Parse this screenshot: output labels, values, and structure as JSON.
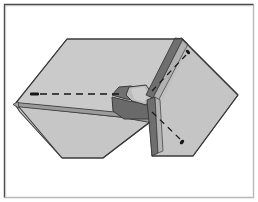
{
  "figure": {
    "title": "Folded sheet fold-line diagram",
    "caption": "",
    "canvas": {
      "width": 258,
      "height": 202
    },
    "colors": {
      "background": "#ffffff",
      "panel_fill": "#c9c9c9",
      "panel_fill_right": "#c4c4c4",
      "outline": "#3a3a3a",
      "crease_dark": "#6e6e6e",
      "crease_darker": "#555555",
      "edge_band": "#8a8a8a",
      "dashed_line": "#1a1a1a",
      "frame_top_left": "#4a4a4a",
      "frame_bottom_right": "#b9b9b9"
    },
    "border": {
      "label": "figure-border",
      "top_left_color": "#4a4a4a",
      "bottom_right_color": "#b9b9b9",
      "inset": 4,
      "stroke_width": 1
    },
    "shapes": {
      "left_panel": {
        "label": "left-panel",
        "points": "67,39 180,39 150,101 128,112 125,118 117,118 34,118 14,105 32,104 17,103"
      },
      "left_panel_main": {
        "label": "left-panel-top-face",
        "points": "67,39 180,39 146,100 118,113 16,103"
      },
      "left_panel_lower": {
        "label": "left-panel-bottom-face",
        "points": "16,106 118,116 150,120 103,158 62,158"
      },
      "right_panel": {
        "label": "right-panel",
        "points": "181,38 238,95 193,156 152,156 150,118 147,103"
      },
      "right_panel_upper": {
        "label": "right-panel-upper-face",
        "points": "181,38 238,95 196,153 152,153 150,112"
      }
    },
    "crease": {
      "label": "central-crease-wedge",
      "wedge_upper": "181,39 147,102 127,100 113,95 121,88 139,86 160,62",
      "wedge_lower": "113,96 129,101 146,103 150,118 124,118 114,112",
      "tongue": "128,88 146,86 152,96 144,104 131,101",
      "band_top": "176,38 183,38 151,104 144,101",
      "band_bottom": "148,103 156,100 152,156 146,152"
    },
    "dashed_lines": [
      {
        "name": "dashed-line-left",
        "x1": 31,
        "y1": 94,
        "x2": 122,
        "y2": 94,
        "lead_dot": {
          "x": 31,
          "y": 94,
          "w": 9,
          "h": 3
        }
      },
      {
        "name": "dashed-line-upper-right",
        "x1": 152,
        "y1": 90,
        "x2": 188,
        "y2": 50,
        "lead_dot": {
          "x": 186,
          "y": 53,
          "w": 3,
          "h": 5
        }
      },
      {
        "name": "dashed-line-lower-right",
        "x1": 152,
        "y1": 112,
        "x2": 183,
        "y2": 143,
        "lead_dot": {
          "x": 180,
          "y": 140,
          "w": 4,
          "h": 5
        }
      }
    ],
    "edges": {
      "left_thin_edge_upper": "16,103 118,113 150,119",
      "left_thin_edge_lower": "14,106 117,117 150,122",
      "left_tip": "14,105 18,101 20,109"
    }
  }
}
